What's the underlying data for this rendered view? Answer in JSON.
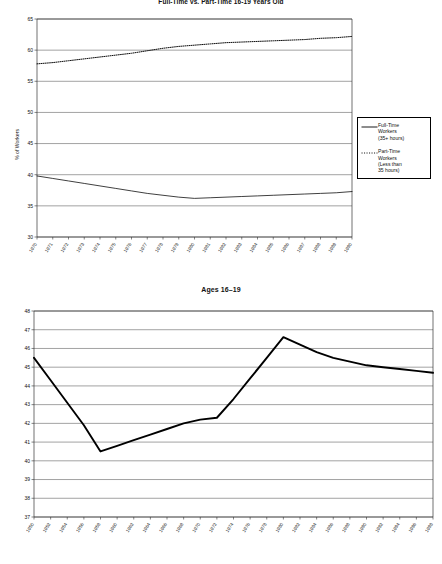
{
  "figures": {
    "top": {
      "title": "Full-Time vs. Part-Time 16-19 Years Old",
      "ylabel": "% of Workers",
      "legend": {
        "items": [
          {
            "label": "Full-Time\nWorkers\n(35+ hours)",
            "style": "solid"
          },
          {
            "label": "Part-Time\nWorkers\n(Less than\n35 hours)",
            "style": "dotted"
          }
        ]
      }
    },
    "bottom": {
      "title": "Ages 16–19"
    }
  },
  "colors": {
    "line": "#000000",
    "grid": "#555555",
    "axis": "#333333",
    "text": "#111111",
    "background": "#ffffff"
  },
  "chart_data": [
    {
      "type": "line",
      "title": "Full-Time vs. Part-Time 16-19 Years Old",
      "xlabel": "",
      "ylabel": "% of Workers",
      "ylim": [
        30,
        65
      ],
      "yticks": [
        30,
        35,
        40,
        45,
        50,
        55,
        60,
        65
      ],
      "grid": true,
      "legend_position": "right",
      "x": [
        1970,
        1971,
        1972,
        1973,
        1974,
        1975,
        1976,
        1977,
        1978,
        1979,
        1980,
        1981,
        1982,
        1983,
        1984,
        1985,
        1986,
        1987,
        1988,
        1989,
        1990
      ],
      "xticklabels": [
        "1970",
        "1971",
        "1972",
        "1973",
        "1974",
        "1975",
        "1976",
        "1977",
        "1978",
        "1979",
        "1980",
        "1981",
        "1982",
        "1983",
        "1984",
        "1985",
        "1986",
        "1987",
        "1988",
        "1989",
        "1990"
      ],
      "series": [
        {
          "name": "Full-Time Workers (35+ hours)",
          "style": "solid",
          "values": [
            39.8,
            39.4,
            39.0,
            38.6,
            38.2,
            37.8,
            37.4,
            37.0,
            36.7,
            36.4,
            36.2,
            36.3,
            36.4,
            36.5,
            36.6,
            36.7,
            36.8,
            36.9,
            37.0,
            37.1,
            37.3
          ]
        },
        {
          "name": "Part-Time Workers (Less than 35 hours)",
          "style": "dotted",
          "values": [
            57.8,
            58.0,
            58.3,
            58.6,
            58.9,
            59.2,
            59.5,
            59.9,
            60.3,
            60.6,
            60.8,
            61.0,
            61.2,
            61.3,
            61.4,
            61.5,
            61.6,
            61.7,
            61.9,
            62.0,
            62.2
          ]
        }
      ]
    },
    {
      "type": "line",
      "title": "Ages 16–19",
      "xlabel": "",
      "ylabel": "",
      "ylim": [
        37,
        48
      ],
      "yticks": [
        37,
        38,
        39,
        40,
        41,
        42,
        43,
        44,
        45,
        46,
        47,
        48
      ],
      "grid": true,
      "legend_position": "none",
      "x": [
        1950,
        1952,
        1954,
        1956,
        1958,
        1960,
        1962,
        1964,
        1966,
        1968,
        1970,
        1972,
        1974,
        1976,
        1978,
        1980,
        1982,
        1984,
        1986,
        1988,
        1990,
        1992,
        1994,
        1996,
        1998
      ],
      "xticklabels": [
        "1950",
        "1952",
        "1954",
        "1956",
        "1958",
        "1960",
        "1962",
        "1964",
        "1966",
        "1968",
        "1970",
        "1972",
        "1974",
        "1976",
        "1978",
        "1980",
        "1982",
        "1984",
        "1986",
        "1988",
        "1990",
        "1992",
        "1994",
        "1996",
        "1998"
      ],
      "series": [
        {
          "name": "Ages 16-19",
          "style": "solid",
          "values": [
            45.5,
            44.3,
            43.1,
            41.9,
            40.5,
            40.8,
            41.1,
            41.4,
            41.7,
            42.0,
            42.2,
            42.3,
            43.3,
            44.4,
            45.5,
            46.6,
            46.2,
            45.8,
            45.5,
            45.3,
            45.1,
            45.0,
            44.9,
            44.8,
            44.7
          ]
        }
      ]
    }
  ]
}
